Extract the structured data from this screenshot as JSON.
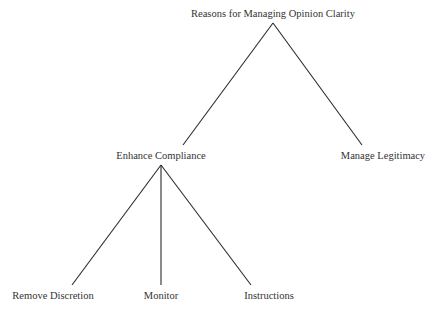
{
  "diagram": {
    "type": "tree",
    "root": {
      "label": "Reasons for Managing Opinion Clarity",
      "x": 273,
      "y": 9
    },
    "nodes": {
      "enhance_compliance": {
        "label": "Enhance Compliance",
        "x": 161,
        "y": 151
      },
      "manage_legitimacy": {
        "label": "Manage Legitimacy",
        "x": 383,
        "y": 151
      },
      "remove_discretion": {
        "label": "Remove Discretion",
        "x": 53,
        "y": 291
      },
      "monitor": {
        "label": "Monitor",
        "x": 161,
        "y": 291
      },
      "instructions": {
        "label": "Instructions",
        "x": 269,
        "y": 291
      }
    },
    "edges": [
      {
        "from": "root",
        "to": "enhance_compliance",
        "x1": 273,
        "y1": 23,
        "x2": 183,
        "y2": 145
      },
      {
        "from": "root",
        "to": "manage_legitimacy",
        "x1": 273,
        "y1": 23,
        "x2": 362,
        "y2": 145
      },
      {
        "from": "enhance_compliance",
        "to": "remove_discretion",
        "x1": 161,
        "y1": 165,
        "x2": 72,
        "y2": 285
      },
      {
        "from": "enhance_compliance",
        "to": "monitor",
        "x1": 161,
        "y1": 165,
        "x2": 161,
        "y2": 285
      },
      {
        "from": "enhance_compliance",
        "to": "instructions",
        "x1": 161,
        "y1": 165,
        "x2": 251,
        "y2": 285
      }
    ]
  }
}
